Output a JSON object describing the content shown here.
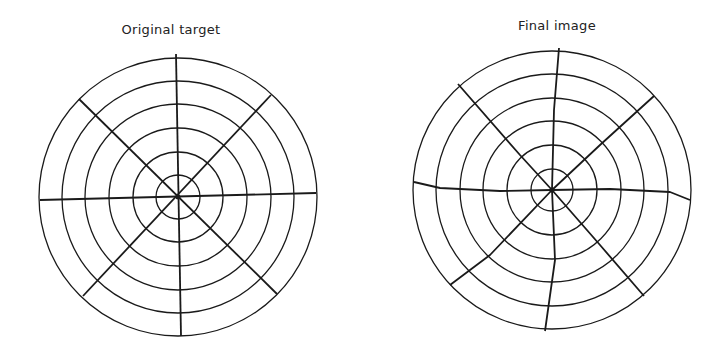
{
  "panels": [
    {
      "title": "Original target",
      "center": [
        178,
        197
      ],
      "ring_radii": [
        22,
        45,
        69,
        93,
        116,
        139
      ],
      "spokes": [
        {
          "from": [
            176,
            54
          ],
          "to": [
            181,
            336
          ]
        },
        {
          "from": [
            40,
            200
          ],
          "to": [
            316,
            193
          ]
        },
        {
          "from": [
            79,
            99
          ],
          "to": [
            277,
            294
          ]
        },
        {
          "from": [
            271,
            95
          ],
          "to": [
            83,
            296
          ]
        }
      ]
    },
    {
      "title": "Final image",
      "center": [
        552,
        190
      ],
      "ring_radii": [
        21,
        45,
        69,
        92,
        116,
        139
      ],
      "spokes": [
        {
          "points": [
            [
              559,
              48
            ],
            [
              554,
              110
            ],
            [
              552,
              190
            ],
            [
              555,
              260
            ],
            [
              545,
              331
            ]
          ]
        },
        {
          "points": [
            [
              414,
              182
            ],
            [
              440,
              188
            ],
            [
              500,
              191
            ],
            [
              552,
              190
            ],
            [
              610,
              189
            ],
            [
              670,
              192
            ],
            [
              690,
              200
            ]
          ]
        },
        {
          "points": [
            [
              458,
              84
            ],
            [
              520,
              155
            ],
            [
              552,
              190
            ],
            [
              600,
              245
            ],
            [
              644,
              296
            ]
          ]
        },
        {
          "points": [
            [
              654,
              96
            ],
            [
              600,
              145
            ],
            [
              552,
              190
            ],
            [
              490,
              255
            ],
            [
              450,
              285
            ]
          ]
        }
      ]
    }
  ],
  "colors": {
    "stroke": "#1a1a1a",
    "background": "#ffffff"
  }
}
